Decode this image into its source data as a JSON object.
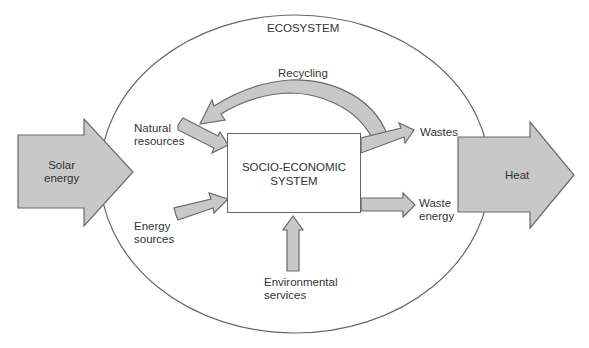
{
  "diagram": {
    "title": "ECOSYSTEM",
    "center_box": {
      "line1": "SOCIO-ECONOMIC",
      "line2": "SYSTEM"
    },
    "inputs": {
      "solar": {
        "line1": "Solar",
        "line2": "energy"
      },
      "natural_resources": {
        "line1": "Natural",
        "line2": "resources"
      },
      "energy_sources": {
        "line1": "Energy",
        "line2": "sources"
      },
      "environmental_services": {
        "line1": "Environmental",
        "line2": "services"
      }
    },
    "outputs": {
      "wastes": "Wastes",
      "waste_energy": {
        "line1": "Waste",
        "line2": "energy"
      },
      "heat": "Heat"
    },
    "loop": {
      "recycling": "Recycling"
    },
    "colors": {
      "arrow_fill": "#c8c8c8",
      "arrow_stroke": "#6a6a6a",
      "line": "#666666",
      "text": "#333333",
      "background": "#ffffff"
    }
  }
}
